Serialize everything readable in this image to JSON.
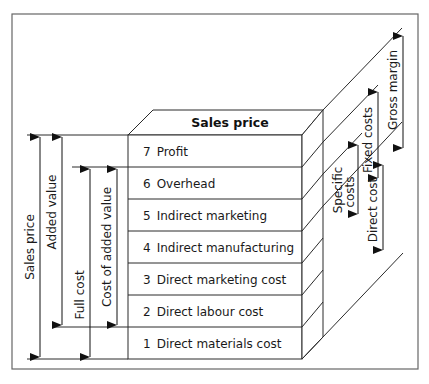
{
  "diagram": {
    "top_label": "Sales price",
    "layers": [
      {
        "number": "7",
        "label": "Profit"
      },
      {
        "number": "6",
        "label": "Overhead"
      },
      {
        "number": "5",
        "label": "Indirect marketing"
      },
      {
        "number": "4",
        "label": "Indirect manufacturing"
      },
      {
        "number": "3",
        "label": "Direct marketing cost"
      },
      {
        "number": "2",
        "label": "Direct labour cost"
      },
      {
        "number": "1",
        "label": "Direct materials cost"
      }
    ],
    "left_dimensions": {
      "sales_price": "Sales price",
      "added_value": "Added value",
      "full_cost": "Full cost",
      "cost_of_added_value": "Cost of added value"
    },
    "right_dimensions": {
      "specific_costs_line1": "Specific",
      "specific_costs_line2": "costs",
      "fixed_costs": "Fixed costs",
      "gross_margin": "Gross margin",
      "direct_cost": "Direct cost"
    },
    "colors": {
      "line": "#2a2a2a",
      "frame": "#555555",
      "background": "#ffffff"
    }
  }
}
